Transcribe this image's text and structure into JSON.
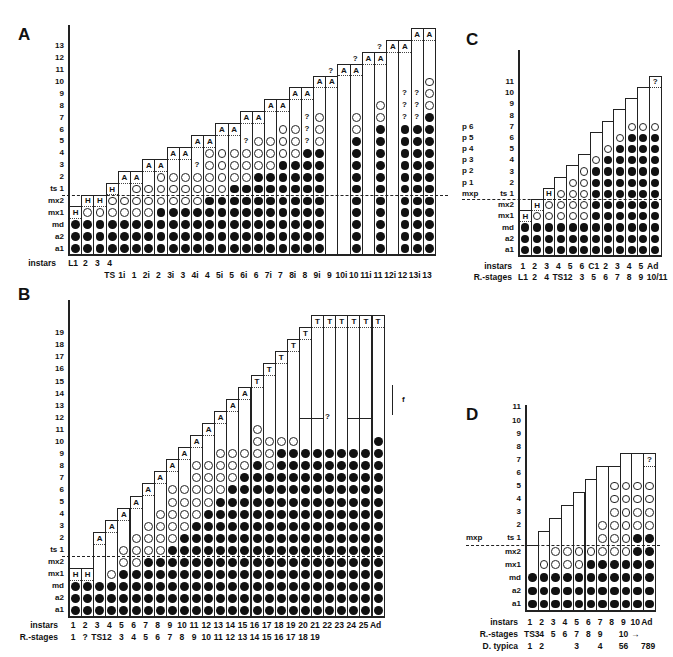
{
  "chart_data": [
    {
      "type": "table",
      "panel": "A",
      "title": "A",
      "row_labels": [
        "a1",
        "a2",
        "md",
        "mx1",
        "mx2",
        "ts 1",
        "2",
        "3",
        "4",
        "5",
        "6",
        "7",
        "8",
        "9",
        "10",
        "11",
        "12",
        "13"
      ],
      "xlabel": "instars",
      "x_top": [
        "L1",
        "2",
        "3",
        "4"
      ],
      "x_bottom": [
        "TS",
        "1i",
        "1",
        "2i",
        "2",
        "3i",
        "3",
        "4i",
        "4",
        "5i",
        "5",
        "6i",
        "6",
        "7i",
        "7",
        "8i",
        "8",
        "9i",
        "9",
        "10i",
        "10",
        "11i",
        "11",
        "12i",
        "12",
        "13i",
        "13"
      ],
      "legend": {
        "F": "filled circle",
        "O": "open circle",
        "?": "uncertain",
        "H/A/T": "top segment label"
      },
      "columns": [
        {
          "x": "L1",
          "cells": "FFF",
          "top": "H"
        },
        {
          "x": "2",
          "cells": "FFFO",
          "top": "H"
        },
        {
          "x": "3",
          "cells": "FFFO",
          "top": "H"
        },
        {
          "x": "4/TS",
          "cells": "FFFOO",
          "top": "H"
        },
        {
          "x": "1i",
          "cells": "FFFOO ",
          "top": "A"
        },
        {
          "x": "1",
          "cells": "FFFOOO",
          "top": "A"
        },
        {
          "x": "2i",
          "cells": "FFFOOO ",
          "top": "A"
        },
        {
          "x": "2",
          "cells": "FFFFOOO",
          "top": "A"
        },
        {
          "x": "3i",
          "cells": "FFFFOOO ",
          "top": "A"
        },
        {
          "x": "3",
          "cells": "FFFFOOO ",
          "top": "A"
        },
        {
          "x": "4i",
          "cells": "FFFFOOO?",
          "top": "A"
        },
        {
          "x": "4",
          "cells": "FFFFFOOOO",
          "top": "A"
        },
        {
          "x": "5i",
          "cells": "FFFFFOOOO",
          "top": "A"
        },
        {
          "x": "5",
          "cells": "FFFFFFOOO",
          "top": "A"
        },
        {
          "x": "6i",
          "cells": "FFFFFFOOO?",
          "top": "A"
        },
        {
          "x": "6",
          "cells": "FFFFFFFOOO",
          "top": "A"
        },
        {
          "x": "7i",
          "cells": "FFFFFFFOOO ",
          "top": "A"
        },
        {
          "x": "7",
          "cells": "FFFFFFFFOOO",
          "top": "A"
        },
        {
          "x": "8i",
          "cells": "FFFFFFFFOOO ",
          "top": "A"
        },
        {
          "x": "8",
          "cells": "FFFFFFFFF???",
          "top": "A"
        },
        {
          "x": "9i",
          "cells": "FFFFFFFFFOOO",
          "top": "A"
        },
        {
          "x": "9",
          "cells": "",
          "top": "A",
          "height": 12,
          "question_above": true
        },
        {
          "x": "10i",
          "cells": "",
          "top": "A",
          "height": 13
        },
        {
          "x": "10",
          "cells": "FFFFFFFFFFOO",
          "top": "A",
          "height": 13,
          "question_above": true
        },
        {
          "x": "11i",
          "cells": "",
          "top": "A",
          "height": 14
        },
        {
          "x": "11",
          "cells": "FFFFFFFFFFFOO",
          "top": "A",
          "height": 14,
          "question_above": true
        },
        {
          "x": "12i",
          "cells": "",
          "top": "A",
          "height": 15
        },
        {
          "x": "12",
          "cells": "FFFFFFFFFFF???",
          "top": "A",
          "height": 15
        },
        {
          "x": "13i",
          "cells": "FFFFFFFFFFF???",
          "top": "A",
          "height": 16
        },
        {
          "x": "13",
          "cells": "FFFFFFFFFFFFOOO",
          "top": "A",
          "height": 16
        }
      ]
    },
    {
      "type": "table",
      "panel": "B",
      "title": "B",
      "row_labels": [
        "a1",
        "a2",
        "md",
        "mx1",
        "mx2",
        "ts 1",
        "2",
        "3",
        "4",
        "5",
        "6",
        "7",
        "8",
        "9",
        "10",
        "11",
        "12",
        "13",
        "14",
        "15",
        "16",
        "17",
        "18",
        "19"
      ],
      "instars": [
        "1",
        "2",
        "3",
        "4",
        "5",
        "6",
        "7",
        "8",
        "9",
        "10",
        "11",
        "12",
        "13",
        "14",
        "15",
        "16",
        "17",
        "18",
        "19",
        "20",
        "21",
        "22",
        "23",
        "24",
        "25",
        "Ad"
      ],
      "r_stages": [
        "1",
        "?",
        "TS1",
        "2",
        "3",
        "4",
        "5",
        "6",
        "7",
        "8",
        "9",
        "10",
        "11",
        "12",
        "13",
        "14",
        "15",
        "16",
        "17",
        "18",
        "19"
      ],
      "annotation_f": "f",
      "question_mark": "?"
    },
    {
      "type": "table",
      "panel": "C",
      "title": "C",
      "row_labels": [
        "a1",
        "a2",
        "md",
        "mx1",
        "mx2",
        "ts 1",
        "2",
        "3",
        "4",
        "5",
        "6",
        "7",
        "8",
        "9",
        "10",
        "11"
      ],
      "left_labels": [
        "mxp",
        "p 1",
        "p 2",
        "p 3",
        "p 4",
        "p 5",
        "p 6"
      ],
      "instars": [
        "1",
        "2",
        "3",
        "4",
        "5",
        "6",
        "C1",
        "2",
        "3",
        "4",
        "5",
        "Ad"
      ],
      "r_stages": [
        "L1",
        "2",
        "4",
        "TS1",
        "2",
        "3",
        "5",
        "6",
        "7",
        "8",
        "9",
        "10/11"
      ]
    },
    {
      "type": "table",
      "panel": "D",
      "title": "D",
      "row_labels": [
        "a1",
        "a2",
        "md",
        "mx1",
        "mx2",
        "ts 1",
        "2",
        "3",
        "4",
        "5",
        "6",
        "7",
        "8",
        "9",
        "10",
        "11"
      ],
      "left_labels": [
        "mxp"
      ],
      "instars": [
        "1",
        "2",
        "3",
        "4",
        "5",
        "6",
        "7",
        "8",
        "9",
        "10",
        "Ad"
      ],
      "r_stages": [
        "TS3",
        "4",
        "5",
        "6",
        "7",
        "8",
        "9",
        "",
        "10",
        "→",
        ""
      ],
      "d_typica": [
        "1",
        "2",
        "",
        "",
        "3",
        "",
        "4",
        "",
        "56",
        "",
        "789"
      ]
    }
  ],
  "labels": {
    "panelA": "A",
    "panelB": "B",
    "panelC": "C",
    "panelD": "D",
    "instars": "instars",
    "rstages": "R.-stages",
    "dtypica": "D. typica",
    "f": "f"
  }
}
